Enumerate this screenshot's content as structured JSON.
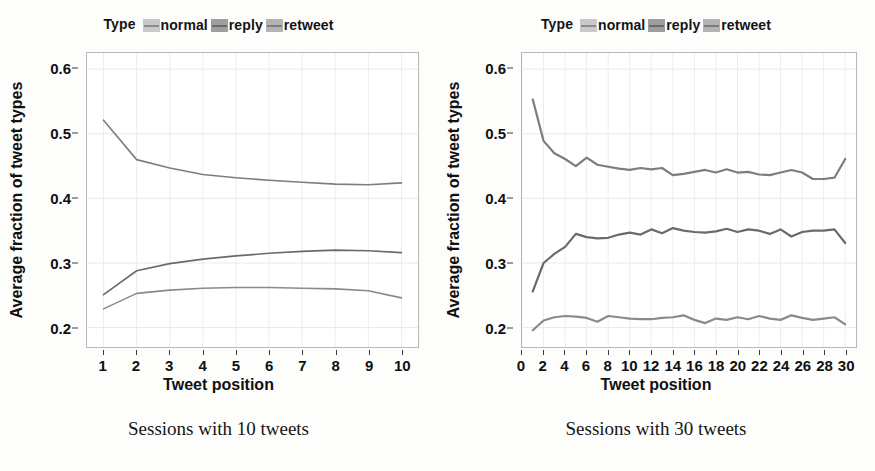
{
  "figure": {
    "background": "#fdfdfc",
    "line_color": "#6f6f6f",
    "axis_color": "#101010"
  },
  "legend": {
    "title": "Type",
    "items": [
      {
        "label": "normal",
        "swatch_bg": "#c9c9c9",
        "line_color": "#8a8a8a"
      },
      {
        "label": "reply",
        "swatch_bg": "#9f9f9f",
        "line_color": "#6a6a6a"
      },
      {
        "label": "retweet",
        "swatch_bg": "#b4b4b4",
        "line_color": "#7d7d7d"
      }
    ]
  },
  "panels": [
    {
      "id": "left",
      "caption": "Sessions with 10 tweets",
      "xlabel": "Tweet position",
      "ylabel": "Average fraction of tweet types",
      "y_ticks": [
        "0.2",
        "0.3",
        "0.4",
        "0.5",
        "0.6"
      ],
      "x_ticks": [
        "1",
        "2",
        "3",
        "4",
        "5",
        "6",
        "7",
        "8",
        "9",
        "10"
      ]
    },
    {
      "id": "right",
      "caption": "Sessions with 30 tweets",
      "xlabel": "Tweet position",
      "ylabel": "Average fraction of tweet types",
      "y_ticks": [
        "0.2",
        "0.3",
        "0.4",
        "0.5",
        "0.6"
      ],
      "x_ticks": [
        "0",
        "2",
        "4",
        "6",
        "8",
        "10",
        "12",
        "14",
        "16",
        "18",
        "20",
        "22",
        "24",
        "26",
        "28",
        "30"
      ]
    }
  ],
  "chart_data": [
    {
      "type": "line",
      "panel": "left",
      "title": "Sessions with 10 tweets",
      "xlabel": "Tweet position",
      "ylabel": "Average fraction of tweet types",
      "xlim": [
        0.5,
        10.5
      ],
      "ylim": [
        0.17,
        0.625
      ],
      "grid": true,
      "legend_position": "top",
      "x": [
        1,
        2,
        3,
        4,
        5,
        6,
        7,
        8,
        9,
        10
      ],
      "series": [
        {
          "name": "retweet",
          "color": "#7d7d7d",
          "values": [
            0.521,
            0.46,
            0.447,
            0.437,
            0.432,
            0.428,
            0.425,
            0.422,
            0.421,
            0.424,
            0.445
          ]
        },
        {
          "name": "reply",
          "color": "#6a6a6a",
          "values": [
            0.251,
            0.288,
            0.299,
            0.306,
            0.311,
            0.315,
            0.318,
            0.32,
            0.319,
            0.316
          ]
        },
        {
          "name": "normal",
          "color": "#8a8a8a",
          "values": [
            0.229,
            0.253,
            0.258,
            0.261,
            0.262,
            0.262,
            0.261,
            0.26,
            0.257,
            0.246
          ]
        }
      ]
    },
    {
      "type": "line",
      "panel": "right",
      "title": "Sessions with 30 tweets",
      "xlabel": "Tweet position",
      "ylabel": "Average fraction of tweet types",
      "xlim": [
        0,
        31
      ],
      "ylim": [
        0.17,
        0.625
      ],
      "grid": true,
      "legend_position": "top",
      "x": [
        1,
        2,
        3,
        4,
        5,
        6,
        7,
        8,
        9,
        10,
        11,
        12,
        13,
        14,
        15,
        16,
        17,
        18,
        19,
        20,
        21,
        22,
        23,
        24,
        25,
        26,
        27,
        28,
        29,
        30
      ],
      "series": [
        {
          "name": "retweet",
          "color": "#7d7d7d",
          "values": [
            0.553,
            0.489,
            0.47,
            0.461,
            0.45,
            0.463,
            0.452,
            0.449,
            0.446,
            0.444,
            0.447,
            0.445,
            0.447,
            0.436,
            0.438,
            0.441,
            0.444,
            0.44,
            0.445,
            0.44,
            0.441,
            0.437,
            0.436,
            0.44,
            0.444,
            0.44,
            0.43,
            0.43,
            0.432,
            0.461
          ]
        },
        {
          "name": "reply",
          "color": "#6a6a6a",
          "values": [
            0.256,
            0.3,
            0.314,
            0.325,
            0.345,
            0.34,
            0.338,
            0.339,
            0.344,
            0.347,
            0.344,
            0.352,
            0.346,
            0.354,
            0.35,
            0.348,
            0.347,
            0.349,
            0.353,
            0.348,
            0.352,
            0.35,
            0.345,
            0.352,
            0.341,
            0.348,
            0.35,
            0.35,
            0.352,
            0.331
          ]
        },
        {
          "name": "normal",
          "color": "#8a8a8a",
          "values": [
            0.196,
            0.211,
            0.216,
            0.218,
            0.217,
            0.215,
            0.209,
            0.218,
            0.216,
            0.214,
            0.213,
            0.213,
            0.215,
            0.216,
            0.219,
            0.212,
            0.207,
            0.214,
            0.212,
            0.216,
            0.213,
            0.218,
            0.214,
            0.212,
            0.219,
            0.215,
            0.212,
            0.214,
            0.216,
            0.205
          ]
        }
      ]
    }
  ]
}
